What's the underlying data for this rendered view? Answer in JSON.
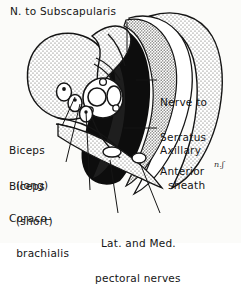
{
  "figure": {
    "type": "anatomical-cross-section",
    "style": "hand-lettered pen-and-ink medical illustration, black ink with stipple shading on white",
    "signature": "n.ʃ"
  },
  "colors": {
    "background": "#fbfbf9",
    "ink": "#151515",
    "fill_dark": "#0d0d0d",
    "stipple_light": "#b9b9b4",
    "stipple_mid": "#8e8e88",
    "paper": "#ffffff"
  },
  "labels": [
    {
      "id": "n-to-subscapularis",
      "text": "N. to Subscapularis",
      "lines": [
        "N. to Subscapularis"
      ],
      "align": "left",
      "x": 10,
      "y": 6,
      "leader": {
        "from": [
          127,
          22
        ],
        "to": [
          127,
          52
        ]
      }
    },
    {
      "id": "nerve-to-serratus-anterior",
      "text": "Nerve to Serratus Anterior",
      "lines": [
        "Nerve to",
        "Serratus",
        "Anterior"
      ],
      "align": "left",
      "x": 160,
      "y": 74,
      "leader": {
        "from": [
          157,
          80
        ],
        "to": [
          136,
          80
        ]
      }
    },
    {
      "id": "axillary-sheath",
      "text": "Axillary sheath",
      "lines": [
        "Axillary",
        "sheath"
      ],
      "align": "left",
      "x": 160,
      "y": 122,
      "leader": {
        "from": [
          157,
          128
        ],
        "to": [
          124,
          128
        ]
      }
    },
    {
      "id": "biceps-long",
      "text": "Biceps (long)",
      "lines": [
        "Biceps",
        "(long)"
      ],
      "align": "left",
      "x": 9,
      "y": 122,
      "leader": {
        "from": [
          62,
          126
        ],
        "to": [
          75,
          97
        ]
      }
    },
    {
      "id": "biceps-short",
      "text": "Biceps (short)",
      "lines": [
        "Biceps",
        "(short)"
      ],
      "align": "left",
      "x": 9,
      "y": 158,
      "leader": {
        "from": [
          66,
          162
        ],
        "to": [
          80,
          104
        ]
      }
    },
    {
      "id": "coracobrachialis",
      "text": "Coraco-brachialis",
      "lines": [
        "Coraco-",
        "  brachialis"
      ],
      "align": "left",
      "x": 9,
      "y": 190,
      "leader": {
        "from": [
          90,
          190
        ],
        "to": [
          86,
          112
        ]
      }
    },
    {
      "id": "lat-and-med-pectoral-nerves",
      "text": "Lat. and Med. pectoral nerves",
      "lines": [
        "Lat. and Med.",
        "pectoral nerves"
      ],
      "align": "left",
      "x": 95,
      "y": 215,
      "leader_left": {
        "from": [
          118,
          213
        ],
        "to": [
          110,
          160
        ]
      },
      "leader_right": {
        "from": [
          160,
          213
        ],
        "to": [
          140,
          163
        ]
      }
    }
  ],
  "structures": [
    {
      "id": "humeral-head",
      "name": "humeral head / scapula body",
      "shading": "stipple-light"
    },
    {
      "id": "chest-wall",
      "name": "thoracic wall with ribs",
      "shading": "stipple-light"
    },
    {
      "id": "axillary-space",
      "name": "axillary fat space",
      "shading": "solid-black"
    },
    {
      "id": "axillary-artery",
      "name": "axillary artery",
      "shading": "outline-circle"
    },
    {
      "id": "axillary-vein",
      "name": "axillary vein",
      "shading": "outline-oval"
    },
    {
      "id": "biceps-long-head",
      "name": "biceps long head",
      "shading": "outline-oval"
    },
    {
      "id": "biceps-short-head",
      "name": "biceps short head",
      "shading": "outline-oval"
    },
    {
      "id": "coracobrachialis-muscle",
      "name": "coracobrachialis",
      "shading": "outline-oval"
    },
    {
      "id": "pectoral-fascia",
      "name": "pectoral fascia layer",
      "shading": "stipple-light"
    }
  ]
}
